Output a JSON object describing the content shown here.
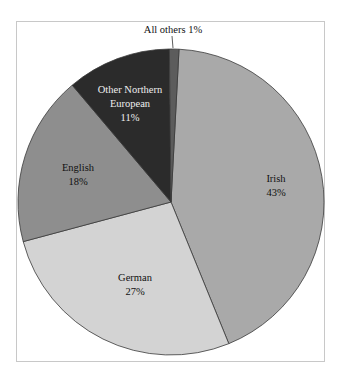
{
  "chart_data": {
    "type": "pie",
    "title": "",
    "start_angle_deg": 3,
    "direction": "clockwise",
    "slices": [
      {
        "label": "Irish",
        "value": 43,
        "pct_label": "43%",
        "color": "#a9a9a9",
        "text_color": "#111111"
      },
      {
        "label": "German",
        "value": 27,
        "pct_label": "27%",
        "color": "#d3d3d3",
        "text_color": "#111111"
      },
      {
        "label": "English",
        "value": 18,
        "pct_label": "18%",
        "color": "#8e8e8e",
        "text_color": "#111111"
      },
      {
        "label": "Other Northern European",
        "value": 11,
        "pct_label": "11%",
        "color": "#2b2b2b",
        "text_color": "#f0f0f0"
      },
      {
        "label": "All others",
        "value": 1,
        "pct_label": "1%",
        "color": "#5c5c5c",
        "text_color": "#111111"
      }
    ]
  },
  "labels": {
    "irish": [
      "Irish",
      "43%"
    ],
    "german": [
      "German",
      "27%"
    ],
    "english": [
      "English",
      "18%"
    ],
    "other_ne": [
      "Other Northern",
      "European",
      "11%"
    ],
    "all_others": "All others 1%"
  }
}
